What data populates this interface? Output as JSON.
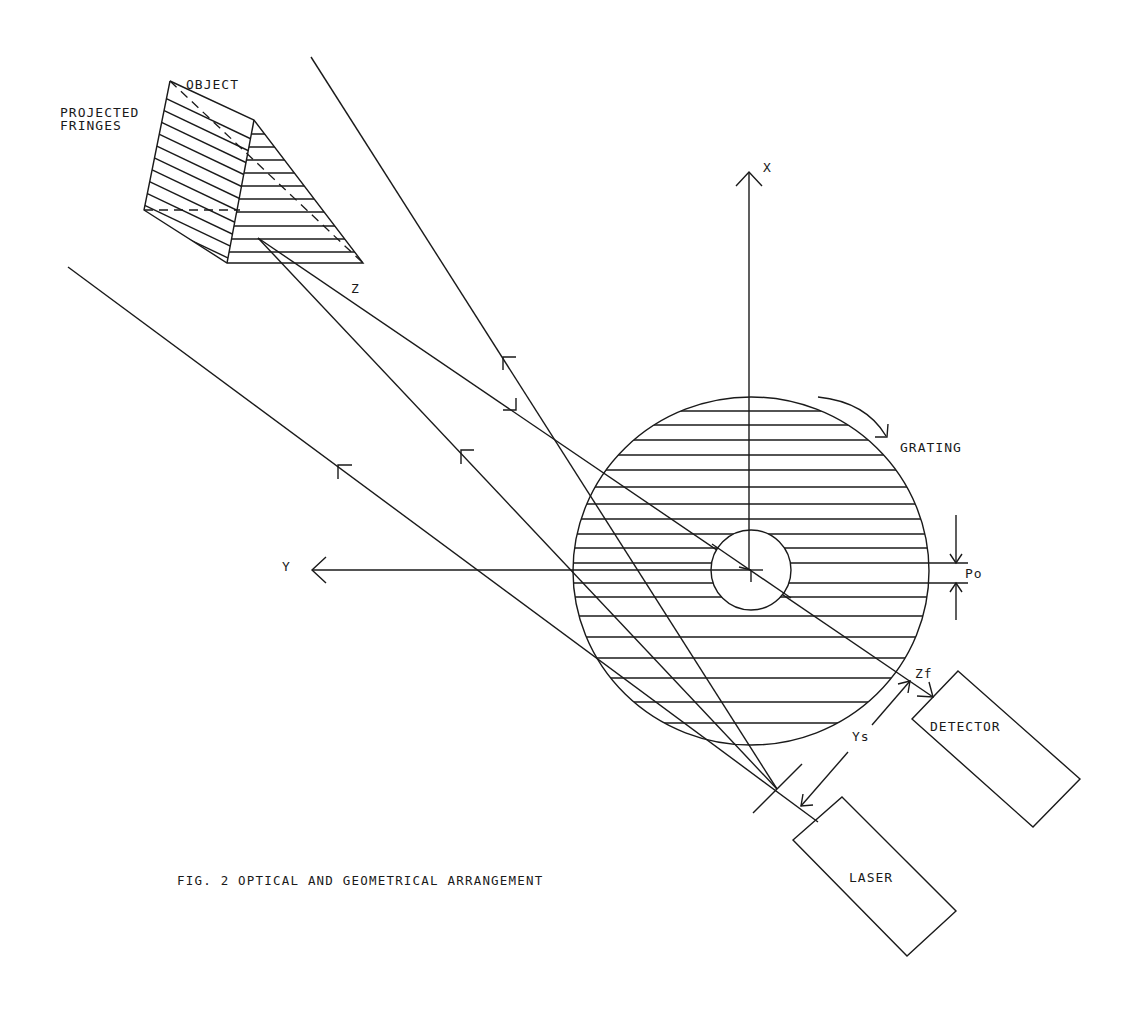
{
  "figure": {
    "caption": "FIG. 2 OPTICAL AND GEOMETRICAL ARRANGEMENT",
    "labels": {
      "object": "OBJECT",
      "projected_fringes_line1": "PROJECTED",
      "projected_fringes_line2": "FRINGES",
      "z": "Z",
      "x_axis": "X",
      "y_axis": "Y",
      "grating": "GRATING",
      "po": "Po",
      "zf": "Zf",
      "ys": "Ys",
      "detector": "DETECTOR",
      "laser": "LASER"
    },
    "colors": {
      "ink": "#1a1a1a",
      "background": "#ffffff"
    }
  }
}
